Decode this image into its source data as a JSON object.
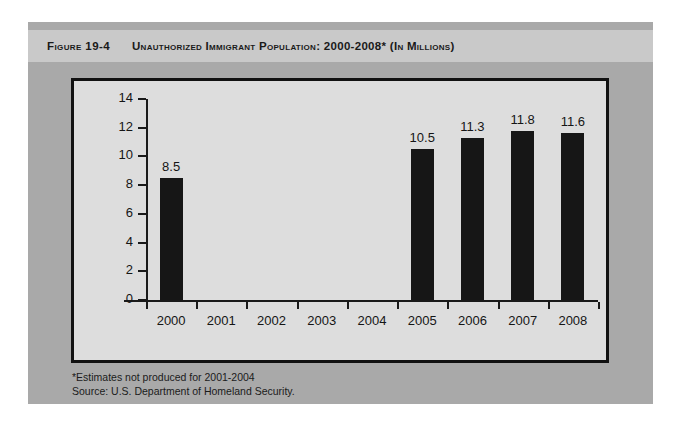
{
  "figure": {
    "label": "Figure 19-4",
    "title": "Unauthorized Immigrant Population: 2000-2008* (In Millions)",
    "footnote": "*Estimates not produced for 2001-2004",
    "source": "Source: U.S. Department of Homeland Security."
  },
  "colors": {
    "page_background": "#ffffff",
    "card_background": "#a9a9a9",
    "title_band": "#c9c9c9",
    "plot_background": "#dddddd",
    "plot_border": "#111111",
    "bar_color": "#161616",
    "text_color": "#151515"
  },
  "chart_data": {
    "type": "bar",
    "title": "Unauthorized Immigrant Population: 2000-2008* (In Millions)",
    "xlabel": "",
    "ylabel": "",
    "unit": "millions",
    "categories": [
      "2000",
      "2001",
      "2002",
      "2003",
      "2004",
      "2005",
      "2006",
      "2007",
      "2008"
    ],
    "values": [
      8.5,
      null,
      null,
      null,
      null,
      10.5,
      11.3,
      11.8,
      11.6
    ],
    "value_labels": [
      "8.5",
      "",
      "",
      "",
      "",
      "10.5",
      "11.3",
      "11.8",
      "11.6"
    ],
    "ylim": [
      0,
      14
    ],
    "yticks": [
      0,
      2,
      4,
      6,
      8,
      10,
      12,
      14
    ],
    "ytick_labels": [
      "0",
      "2",
      "4",
      "6",
      "8",
      "10",
      "12",
      "14"
    ],
    "grid": false,
    "legend": false,
    "missing_note": "No bars for 2001-2004; estimates not produced."
  }
}
